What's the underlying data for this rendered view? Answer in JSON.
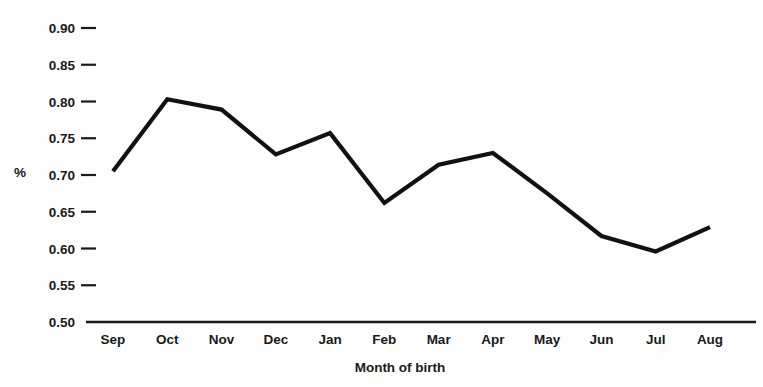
{
  "chart_data": {
    "type": "line",
    "title": "",
    "subtitle": "",
    "xlabel": "Month of birth",
    "ylabel": "%",
    "categories": [
      "Sep",
      "Oct",
      "Nov",
      "Dec",
      "Jan",
      "Feb",
      "Mar",
      "Apr",
      "May",
      "Jun",
      "Jul",
      "Aug"
    ],
    "values": [
      0.705,
      0.803,
      0.789,
      0.728,
      0.757,
      0.662,
      0.714,
      0.73,
      0.675,
      0.617,
      0.596,
      0.629
    ],
    "series": [
      {
        "name": "",
        "values": [
          0.705,
          0.803,
          0.789,
          0.728,
          0.757,
          0.662,
          0.714,
          0.73,
          0.675,
          0.617,
          0.596,
          0.629
        ]
      }
    ],
    "ylim": [
      0.5,
      0.9
    ],
    "ytick_labels": [
      "0.90",
      "0.85",
      "0.80",
      "0.75",
      "0.70",
      "0.65",
      "0.60",
      "0.55",
      "0.50"
    ],
    "ytick_values": [
      0.9,
      0.85,
      0.8,
      0.75,
      0.7,
      0.65,
      0.6,
      0.55,
      0.5
    ],
    "grid": false,
    "legend": "none",
    "line_color": "#111111"
  },
  "axes": {
    "y_label": "%",
    "x_label": "Month of birth"
  }
}
